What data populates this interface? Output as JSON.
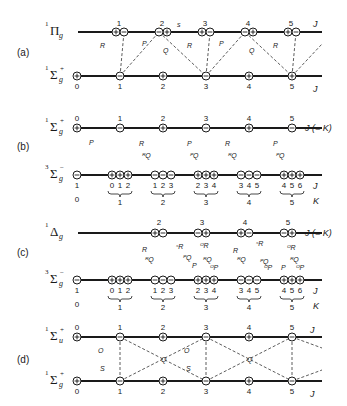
{
  "panels": [
    {
      "id": "a",
      "label": "(a)",
      "upper_state": {
        "mult": "1",
        "sym": "Π",
        "sub": "g",
        "sup": ""
      },
      "lower_state": {
        "mult": "1",
        "sym": "Σ",
        "sub": "g",
        "sup": "+"
      },
      "upper_levels": [
        {
          "J": "1",
          "parities": [
            "+",
            "−"
          ]
        },
        {
          "J": "2",
          "parities": [
            "−",
            "+"
          ]
        },
        {
          "J": "3",
          "parities": [
            "+",
            "−"
          ]
        },
        {
          "J": "4",
          "parities": [
            "−",
            "+"
          ]
        },
        {
          "J": "5",
          "parities": [
            "+",
            "−"
          ]
        }
      ],
      "lower_levels": [
        {
          "J": "0",
          "parity": "+"
        },
        {
          "J": "1",
          "parity": "−"
        },
        {
          "J": "2",
          "parity": "+"
        },
        {
          "J": "3",
          "parity": "−"
        },
        {
          "J": "4",
          "parity": "+"
        },
        {
          "J": "5",
          "parity": "+"
        }
      ],
      "upper_axis_label": "J",
      "lower_axis_label": "J",
      "branch_labels": [
        "R",
        "P",
        "Q",
        "R",
        "P",
        "Q",
        "R"
      ],
      "extra_mark": "s"
    },
    {
      "id": "b",
      "label": "(b)",
      "upper_state": {
        "mult": "1",
        "sym": "Σ",
        "sub": "g",
        "sup": "+"
      },
      "lower_state": {
        "mult": "3",
        "sym": "Σ",
        "sub": "g",
        "sup": "−"
      },
      "upper_levels": [
        {
          "J": "0",
          "parity": "+"
        },
        {
          "J": "1",
          "parity": "−"
        },
        {
          "J": "2",
          "parity": "+"
        },
        {
          "J": "3",
          "parity": "−"
        },
        {
          "J": "4",
          "parity": "+"
        },
        {
          "J": "5",
          "parity": "−"
        }
      ],
      "lower_first": {
        "J": "1",
        "K": "0",
        "parity": "−"
      },
      "lower_groups": [
        {
          "K": "1",
          "J": [
            "0",
            "1",
            "2"
          ],
          "parity": "+"
        },
        {
          "K": "2",
          "J": [
            "1",
            "2",
            "3"
          ],
          "parity": "−"
        },
        {
          "K": "3",
          "J": [
            "2",
            "3",
            "4"
          ],
          "parity": "+"
        },
        {
          "K": "4",
          "J": [
            "3",
            "4",
            "5"
          ],
          "parity": "−"
        },
        {
          "K": "5",
          "J": [
            "4",
            "5",
            "6"
          ],
          "parity": "+"
        }
      ],
      "upper_axis_label": "J (= K)",
      "lower_axis_label_J": "J",
      "lower_axis_label_K": "K",
      "branch_labels": [
        "P",
        "R",
        "ᴿQ",
        "P",
        "ᴾQ",
        "R",
        "ᴿQ",
        "P",
        "ᴾQ"
      ]
    },
    {
      "id": "c",
      "label": "(c)",
      "upper_state": {
        "mult": "1",
        "sym": "Δ",
        "sub": "g",
        "sup": ""
      },
      "lower_state": {
        "mult": "3",
        "sym": "Σ",
        "sub": "g",
        "sup": "−"
      },
      "upper_levels": [
        {
          "J": "2",
          "parities": [
            "+",
            "−"
          ]
        },
        {
          "J": "3",
          "parities": [
            "−",
            "+"
          ]
        },
        {
          "J": "4",
          "parities": [
            "+",
            "−"
          ]
        },
        {
          "J": "5",
          "parities": [
            "−",
            "+"
          ]
        }
      ],
      "lower_first": {
        "J": "1",
        "K": "0",
        "parity": "−"
      },
      "lower_groups": [
        {
          "K": "1",
          "J": [
            "0",
            "1",
            "2"
          ],
          "parity": "+"
        },
        {
          "K": "2",
          "J": [
            "1",
            "2",
            "3"
          ],
          "parity": "−"
        },
        {
          "K": "3",
          "J": [
            "2",
            "3",
            "4"
          ],
          "parity": "+"
        },
        {
          "K": "4",
          "J": [
            "3",
            "4",
            "5"
          ],
          "parity": "−"
        },
        {
          "K": "5",
          "J": [
            "4",
            "5",
            "6"
          ],
          "parity": "+"
        }
      ],
      "upper_axis_label": "J (= K)",
      "lower_axis_label_J": "J",
      "lower_axis_label_K": "K",
      "branch_labels": [
        "R",
        "ᴿQ",
        "ˢR",
        "ᴾQ",
        "P",
        "ᴼR",
        "ᴿQ",
        "ᴼP",
        "R",
        "ᴿQ",
        "ˢR",
        "ᴾQ",
        "ᴼP",
        "P",
        "ᴼR",
        "ᴿQ",
        "ᴼP"
      ]
    },
    {
      "id": "d",
      "label": "(d)",
      "upper_state": {
        "mult": "1",
        "sym": "Σ",
        "sub": "u",
        "sup": "+"
      },
      "lower_state": {
        "mult": "1",
        "sym": "Σ",
        "sub": "g",
        "sup": "+"
      },
      "upper_levels": [
        {
          "J": "0",
          "parity": "+"
        },
        {
          "J": "1",
          "parity": "−"
        },
        {
          "J": "2",
          "parity": "+"
        },
        {
          "J": "3",
          "parity": "−"
        },
        {
          "J": "4",
          "parity": "+"
        },
        {
          "J": "5",
          "parity": "−"
        }
      ],
      "lower_levels": [
        {
          "J": "0",
          "parity": "+"
        },
        {
          "J": "1",
          "parity": "−"
        },
        {
          "J": "2",
          "parity": "+"
        },
        {
          "J": "3",
          "parity": "−"
        },
        {
          "J": "4",
          "parity": "+"
        },
        {
          "J": "5",
          "parity": "−"
        }
      ],
      "upper_axis_label": "J",
      "lower_axis_label": "J",
      "branch_labels": [
        "O",
        "S",
        "Q",
        "O",
        "S",
        "Q"
      ]
    }
  ]
}
